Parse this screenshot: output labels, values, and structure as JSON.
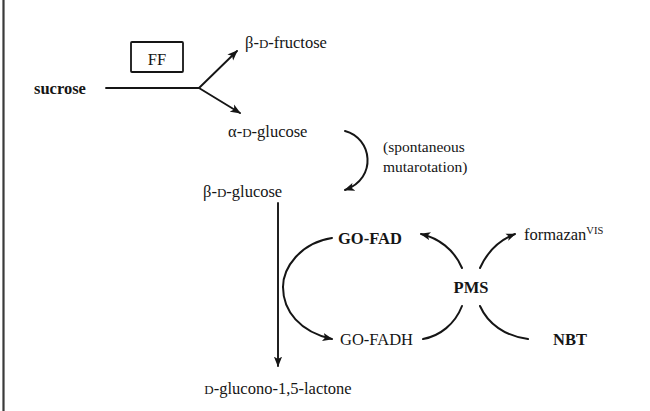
{
  "figure": {
    "background_color": "#ffffff",
    "ink_color": "#151515"
  },
  "nodes": {
    "sucrose": "sucrose",
    "enzyme_box": "FF",
    "fructose_greek": "β",
    "fructose_sep1": "-",
    "fructose_config": "D",
    "fructose_name": "-fructose",
    "alpha_glucose_greek": "α",
    "alpha_glucose_sep": "-",
    "alpha_glucose_config": "D",
    "alpha_glucose_name": "-glucose",
    "beta_glucose_greek": "β",
    "beta_glucose_sep": "-",
    "beta_glucose_config": "D",
    "beta_glucose_name": "-glucose",
    "go_fad": "GO-FAD",
    "go_fadh": "GO-FADH",
    "pms": "PMS",
    "nbt": "NBT",
    "formazan_name": "formazan",
    "formazan_superscript": "VIS",
    "lactone_config": "D",
    "lactone_name": "-glucono-1,5-lactone"
  },
  "annotations": {
    "mutarotation_line1": "(spontaneous",
    "mutarotation_line2": "mutarotation)"
  }
}
